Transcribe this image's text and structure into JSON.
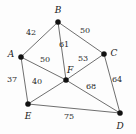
{
  "figure": {
    "type": "weighted-graph-diagram",
    "background_color": "#fdfdfd",
    "edge_color": "#4a4a4a",
    "vertex_color": "#111111",
    "label_color": "#1a1a1a",
    "width": 136,
    "height": 134
  },
  "vertices": [
    {
      "id": "A",
      "label": "A",
      "x": 21,
      "y": 57,
      "label_x": 11,
      "label_y": 54
    },
    {
      "id": "B",
      "label": "B",
      "x": 58,
      "y": 22,
      "label_x": 58,
      "label_y": 10
    },
    {
      "id": "C",
      "label": "C",
      "x": 104,
      "y": 54,
      "label_x": 114,
      "label_y": 53
    },
    {
      "id": "D",
      "label": "D",
      "x": 120,
      "y": 113,
      "label_x": 120,
      "label_y": 126
    },
    {
      "id": "E",
      "label": "E",
      "x": 28,
      "y": 104,
      "label_x": 28,
      "label_y": 116
    },
    {
      "id": "F",
      "label": "F",
      "x": 66,
      "y": 80,
      "label_x": 70,
      "label_y": 70
    }
  ],
  "edges": [
    {
      "from": "A",
      "to": "B",
      "weight": "42",
      "label_x": 31,
      "label_y": 33
    },
    {
      "from": "B",
      "to": "C",
      "weight": "50",
      "label_x": 85,
      "label_y": 31
    },
    {
      "from": "B",
      "to": "F",
      "weight": "61",
      "label_x": 64,
      "label_y": 45
    },
    {
      "from": "A",
      "to": "F",
      "weight": "50",
      "label_x": 45,
      "label_y": 60
    },
    {
      "from": "C",
      "to": "F",
      "weight": "53",
      "label_x": 83,
      "label_y": 59
    },
    {
      "from": "A",
      "to": "E",
      "weight": "37",
      "label_x": 12,
      "label_y": 80
    },
    {
      "from": "E",
      "to": "F",
      "weight": "40",
      "label_x": 37,
      "label_y": 82
    },
    {
      "from": "F",
      "to": "D",
      "weight": "68",
      "label_x": 91,
      "label_y": 87
    },
    {
      "from": "C",
      "to": "D",
      "weight": "64",
      "label_x": 117,
      "label_y": 80
    },
    {
      "from": "E",
      "to": "D",
      "weight": "75",
      "label_x": 69,
      "label_y": 117
    }
  ]
}
